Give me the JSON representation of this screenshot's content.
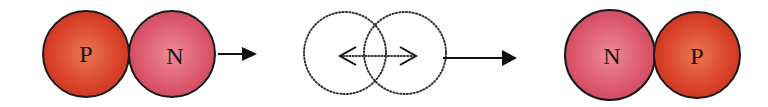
{
  "diagram": {
    "type": "nucleon-exchange",
    "stages": [
      {
        "name": "initial-pair",
        "particles": [
          {
            "label": "P",
            "name": "proton",
            "color": "#d9402a",
            "highlight": "#ea6a45",
            "cx": 86,
            "cy": 54,
            "r": 43
          },
          {
            "label": "N",
            "name": "neutron",
            "color": "#d9546a",
            "highlight": "#ea7a88",
            "cx": 172,
            "cy": 54,
            "r": 43
          }
        ]
      },
      {
        "name": "exchange",
        "description": "overlapping dotted circles with double-headed exchange arrow",
        "dotted_circles": [
          {
            "cx": 345,
            "cy": 53,
            "r": 40
          },
          {
            "cx": 405,
            "cy": 53,
            "r": 40
          }
        ],
        "exchange_arrow": {
          "x1": 342,
          "x2": 416,
          "y": 56
        }
      },
      {
        "name": "final-pair",
        "particles": [
          {
            "label": "N",
            "name": "neutron",
            "color": "#d9546a",
            "highlight": "#ea7a88",
            "cx": 610,
            "cy": 55,
            "r": 45
          },
          {
            "label": "P",
            "name": "proton",
            "color": "#d9402a",
            "highlight": "#ea6a45",
            "cx": 696,
            "cy": 55,
            "r": 43
          }
        ]
      }
    ],
    "arrows": [
      {
        "name": "arrow-1",
        "x1": 218,
        "x2": 256,
        "y": 54
      },
      {
        "name": "arrow-2",
        "x1": 443,
        "x2": 516,
        "y": 58
      }
    ],
    "colors": {
      "outline": "#1a1a1a",
      "arrow": "#111111",
      "dots": "#333333"
    }
  }
}
